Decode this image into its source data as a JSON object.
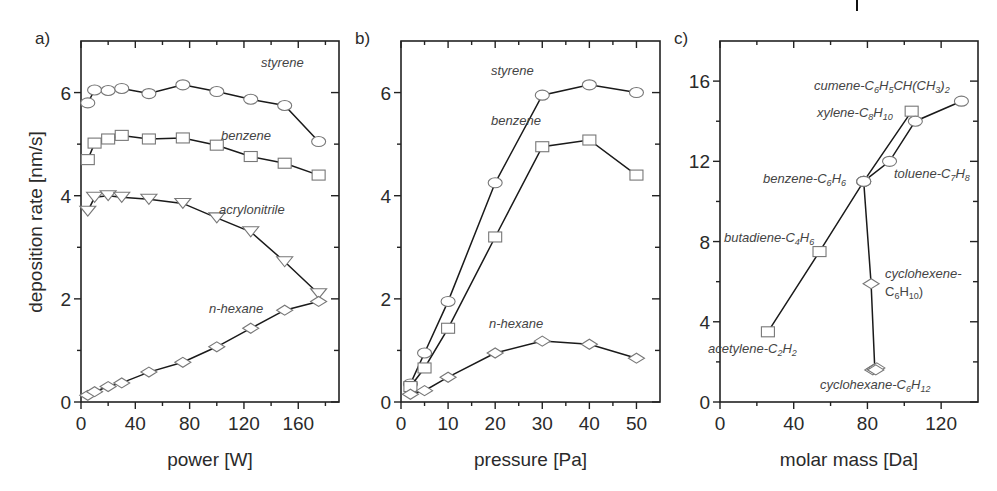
{
  "figure": {
    "y_axis_label": "deposition rate [nm/s]"
  },
  "chart_data": [
    {
      "type": "line",
      "panel_label": "a)",
      "xlabel": "power [W]",
      "ylabel": "deposition rate [nm/s]",
      "xlim": [
        0,
        190
      ],
      "ylim": [
        0,
        7
      ],
      "xticks": [
        0,
        40,
        80,
        120,
        160
      ],
      "xminor": [
        20,
        60,
        100,
        140,
        180
      ],
      "yticks": [
        0,
        2,
        4,
        6
      ],
      "yminor": [
        1,
        3,
        5
      ],
      "grid": false,
      "series": [
        {
          "name": "styrene",
          "marker": "circle",
          "x": [
            5,
            10,
            20,
            30,
            50,
            75,
            100,
            125,
            150,
            175
          ],
          "y": [
            5.8,
            6.05,
            6.04,
            6.08,
            5.98,
            6.15,
            6.02,
            5.87,
            5.75,
            5.05
          ],
          "label_pos": [
            180,
            67
          ]
        },
        {
          "name": "benzene",
          "marker": "square",
          "x": [
            5,
            10,
            20,
            30,
            50,
            75,
            100,
            125,
            150,
            175
          ],
          "y": [
            4.7,
            5.02,
            5.1,
            5.17,
            5.1,
            5.12,
            4.98,
            4.76,
            4.63,
            4.4
          ],
          "label_pos": [
            140,
            140
          ]
        },
        {
          "name": "acrylonitrile",
          "marker": "triangle-down",
          "x": [
            5,
            10,
            20,
            30,
            50,
            75,
            100,
            125,
            150,
            175
          ],
          "y": [
            3.7,
            3.97,
            4.0,
            3.97,
            3.93,
            3.85,
            3.57,
            3.3,
            2.72,
            2.1
          ],
          "label_pos": [
            138,
            214
          ]
        },
        {
          "name": "n-hexane",
          "marker": "diamond",
          "x": [
            5,
            10,
            20,
            30,
            50,
            75,
            100,
            125,
            150,
            175
          ],
          "y": [
            0.13,
            0.2,
            0.3,
            0.37,
            0.58,
            0.77,
            1.07,
            1.43,
            1.78,
            1.95
          ],
          "label_pos": [
            128,
            313
          ]
        }
      ]
    },
    {
      "type": "line",
      "panel_label": "b)",
      "xlabel": "pressure [Pa]",
      "ylabel": "",
      "xlim": [
        0,
        55
      ],
      "ylim": [
        0,
        7
      ],
      "xticks": [
        0,
        10,
        20,
        30,
        40,
        50
      ],
      "xminor": [
        5,
        15,
        25,
        35,
        45
      ],
      "yticks": [
        0,
        2,
        4,
        6
      ],
      "yminor": [
        1,
        3,
        5
      ],
      "grid": false,
      "series": [
        {
          "name": "styrene",
          "marker": "circle",
          "x": [
            2,
            5,
            10,
            20,
            30,
            40,
            50
          ],
          "y": [
            0.35,
            0.95,
            1.95,
            4.25,
            5.95,
            6.15,
            6.0
          ],
          "label_pos": [
            30,
            75
          ]
        },
        {
          "name": "benzene",
          "marker": "square",
          "x": [
            2,
            5,
            10,
            20,
            30,
            40,
            50
          ],
          "y": [
            0.3,
            0.66,
            1.43,
            3.2,
            4.95,
            5.08,
            4.4
          ],
          "label_pos": [
            30,
            125
          ]
        },
        {
          "name": "n-hexane",
          "marker": "diamond",
          "x": [
            2,
            5,
            10,
            20,
            30,
            40,
            50
          ],
          "y": [
            0.15,
            0.22,
            0.48,
            0.95,
            1.18,
            1.12,
            0.85
          ],
          "label_pos": [
            28,
            328
          ]
        }
      ]
    },
    {
      "type": "line",
      "panel_label": "c)",
      "xlabel": "molar mass [Da]",
      "ylabel": "",
      "xlim": [
        0,
        140
      ],
      "ylim": [
        0,
        18
      ],
      "xticks": [
        0,
        40,
        80,
        120
      ],
      "xminor": [
        20,
        60,
        100
      ],
      "yticks": [
        0,
        4,
        8,
        12,
        16
      ],
      "yminor": [
        2,
        6,
        10,
        14
      ],
      "grid": false,
      "series": [
        {
          "name": "acetylene-butadiene-benzene-xylene",
          "marker": "square-mixed",
          "points": [
            {
              "x": 26,
              "y": 3.5,
              "marker": "square",
              "label": "acetylene-C2H2",
              "sub": [
                "acetylene-C",
                "2",
                "H",
                "2"
              ],
              "label_pos": [
                708,
                353
              ]
            },
            {
              "x": 54,
              "y": 7.5,
              "marker": "square",
              "label": "butadiene-C4H6",
              "sub": [
                "butadiene-C",
                "4",
                "H",
                "6"
              ],
              "label_pos": [
                724,
                242
              ]
            },
            {
              "x": 78,
              "y": 11.0,
              "marker": "ellipse",
              "label": "benzene-C6H6",
              "sub": [
                "benzene-C",
                "6",
                "H",
                "6"
              ],
              "label_pos": [
                763,
                183
              ]
            },
            {
              "x": 104,
              "y": 14.5,
              "marker": "square",
              "label": "xylene-C8H10",
              "sub": [
                "xylene-C",
                "8",
                "H",
                "10"
              ],
              "label_pos": [
                817,
                117
              ]
            }
          ]
        },
        {
          "name": "benzene-toluene-cumene",
          "marker": "ellipse",
          "points": [
            {
              "x": 78,
              "y": 11.0,
              "marker": "ellipse"
            },
            {
              "x": 92,
              "y": 12.0,
              "marker": "ellipse",
              "label": "toluene-C7H8",
              "sub": [
                "toluene-C",
                "7",
                "H",
                "8"
              ],
              "label_pos": [
                894,
                178
              ]
            },
            {
              "x": 106,
              "y": 14.0,
              "marker": "ellipse"
            },
            {
              "x": 131,
              "y": 15.0,
              "marker": "ellipse",
              "label": "cumene-C6H5CH(CH3)2",
              "sub": [
                "cumene-C",
                "6",
                "H",
                "5",
                "CH(CH",
                "3",
                ")",
                "2"
              ],
              "label_pos": [
                814,
                90
              ]
            }
          ]
        },
        {
          "name": "benzene-cyclohexene-cyclohexane",
          "marker": "diamond",
          "points": [
            {
              "x": 78,
              "y": 11.0,
              "marker": "ellipse"
            },
            {
              "x": 82,
              "y": 5.9,
              "marker": "diamond",
              "label": "cyclohexene-C6H10)",
              "label_line1": "cyclohexene-",
              "sub": [
                "C",
                "6",
                "H",
                "10",
                ")"
              ],
              "label_pos": [
                885,
                278
              ]
            },
            {
              "x": 84,
              "y": 1.65,
              "marker": "diamond-cluster",
              "label": "cyclohexane-C6H12",
              "sub": [
                "cyclohexane-C",
                "6",
                "H",
                "12"
              ],
              "label_pos": [
                820,
                389
              ]
            }
          ]
        }
      ]
    }
  ]
}
